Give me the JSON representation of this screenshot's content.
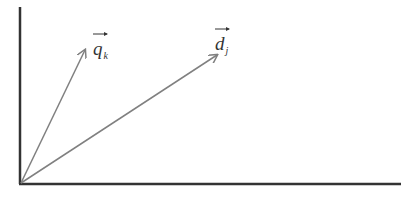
{
  "diagram": {
    "type": "vector-space",
    "colors": {
      "axis": "#333333",
      "vector": "#808080",
      "text": "#333333"
    },
    "axes": {
      "origin": [
        20,
        184
      ],
      "y_axis_top": [
        20,
        7
      ],
      "x_axis_end": [
        401,
        184
      ]
    },
    "vectors": [
      {
        "id": "q_k",
        "main": "q",
        "sub": "k",
        "from": [
          20,
          184
        ],
        "to": [
          85,
          50
        ]
      },
      {
        "id": "d_j",
        "main": "d",
        "sub": "j",
        "from": [
          20,
          184
        ],
        "to": [
          217,
          55
        ]
      }
    ]
  }
}
